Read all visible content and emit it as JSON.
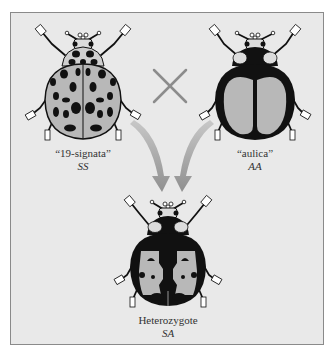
{
  "figure": {
    "parents": [
      {
        "name": "“19-signata”",
        "genotype": "SS",
        "pattern": "spotted"
      },
      {
        "name": "“aulica”",
        "genotype": "AA",
        "pattern": "black-with-pale-elytra-patches"
      }
    ],
    "cross_symbol": "×",
    "offspring": {
      "name": "Heterozygote",
      "genotype": "SA",
      "pattern": "mosaic"
    },
    "colors": {
      "background": "#e9e9e9",
      "border": "#8a8a8a",
      "black": "#111111",
      "elytra_pale": "#b8b8b8",
      "pronotum_pale": "#d8d8d8",
      "arrow": "#9a9a9a",
      "cross": "#8c8c8c"
    }
  }
}
